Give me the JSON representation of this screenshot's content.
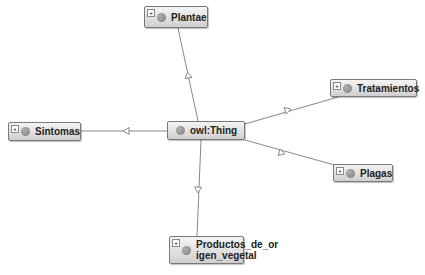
{
  "diagram": {
    "type": "ontology-class-graph",
    "root": {
      "id": "owl-thing",
      "label": "owl:Thing",
      "x": 167,
      "y": 121,
      "w": 78,
      "h": 19
    },
    "nodes": [
      {
        "id": "plantae",
        "label": "Plantae",
        "x": 144,
        "y": 6,
        "w": 64,
        "h": 22
      },
      {
        "id": "tratamientos",
        "label": "Tratamientos",
        "x": 330,
        "y": 79,
        "w": 87,
        "h": 18
      },
      {
        "id": "sintomas",
        "label": "Sintomas",
        "x": 8,
        "y": 122,
        "w": 73,
        "h": 19
      },
      {
        "id": "plagas",
        "label": "Plagas",
        "x": 333,
        "y": 164,
        "w": 60,
        "h": 18
      },
      {
        "id": "productos",
        "label": "Productos_de_or\nigen_vegetal",
        "line1": "Productos_de_or",
        "line2": "igen_vegetal",
        "x": 169,
        "y": 236,
        "w": 75,
        "h": 28
      }
    ],
    "edges": [
      {
        "from": "owl-thing",
        "to": "plantae",
        "x1": 198,
        "y1": 121,
        "x2": 178,
        "y2": 28,
        "arrow_at": [
          188,
          75
        ]
      },
      {
        "from": "owl-thing",
        "to": "tratamientos",
        "x1": 245,
        "y1": 124,
        "x2": 338,
        "y2": 97,
        "arrow_at": [
          288,
          110
        ]
      },
      {
        "from": "owl-thing",
        "to": "sintomas",
        "x1": 167,
        "y1": 131,
        "x2": 81,
        "y2": 131,
        "arrow_at": [
          126,
          131
        ]
      },
      {
        "from": "owl-thing",
        "to": "plagas",
        "x1": 245,
        "y1": 140,
        "x2": 338,
        "y2": 166,
        "arrow_at": [
          282,
          153
        ]
      },
      {
        "from": "owl-thing",
        "to": "productos",
        "x1": 201,
        "y1": 140,
        "x2": 197,
        "y2": 236,
        "arrow_at": [
          198,
          190
        ]
      }
    ],
    "edge_style": {
      "color": "#888888",
      "arrow": "hollow-triangle"
    },
    "expand_icon": "+"
  }
}
